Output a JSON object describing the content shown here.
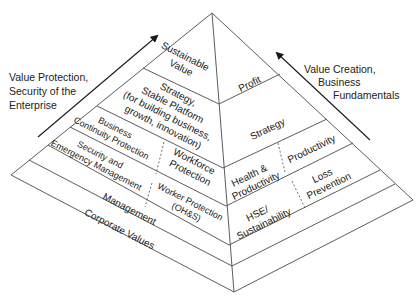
{
  "diagram": {
    "type": "pyramid",
    "colors": {
      "line": "#4a4a4a",
      "text": "#222222",
      "background": "#ffffff"
    },
    "left_annotation": {
      "lines": [
        "Value Protection,",
        "Security of the",
        "Enterprise"
      ],
      "arrow_direction": "up-right"
    },
    "right_annotation": {
      "lines": [
        "Value Creation,",
        "Business",
        "Fundamentals"
      ],
      "arrow_direction": "up-left"
    },
    "left_face": {
      "tiers": [
        {
          "lines": [
            "Sustainable",
            "Value"
          ]
        },
        {
          "lines": [
            "Strategy,",
            "Stable Platform",
            "(for building business,",
            "growth, innovation)"
          ]
        },
        {
          "split": true,
          "left": {
            "lines": [
              "Business",
              "Continuity Protection"
            ]
          },
          "right": {
            "lines": [
              "Workforce",
              "Protection"
            ]
          }
        },
        {
          "split": true,
          "left": {
            "lines": [
              "Security and",
              "Emergency Management"
            ]
          },
          "right": {
            "lines": [
              "Worker Protection",
              "(OH&S)"
            ]
          }
        },
        {
          "lines": [
            "Management"
          ]
        },
        {
          "lines": [
            "Corporate Values"
          ]
        }
      ]
    },
    "right_face": {
      "tiers": [
        {
          "lines": [
            "Profit"
          ]
        },
        {
          "lines": [
            "Strategy"
          ]
        },
        {
          "split": true,
          "left": {
            "lines": [
              "Health &",
              "Productivity"
            ]
          },
          "right": {
            "lines": [
              "Productivity"
            ]
          }
        },
        {
          "split": true,
          "left": {
            "lines": [
              "HSE/",
              "Sustainability"
            ]
          },
          "right": {
            "lines": [
              "Loss",
              "Prevention"
            ]
          }
        },
        {
          "lines": []
        },
        {
          "lines": []
        }
      ]
    }
  }
}
